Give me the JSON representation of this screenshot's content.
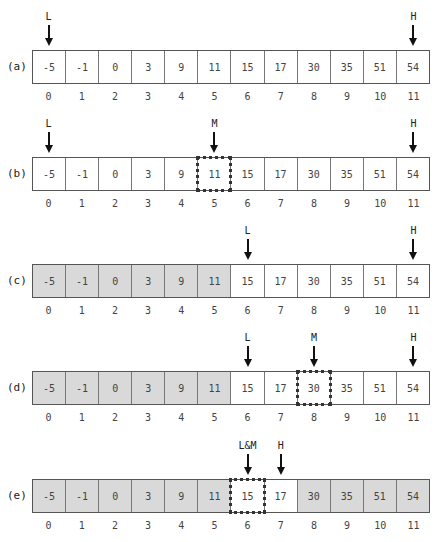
{
  "values": [
    "-5",
    "-1",
    "0",
    "3",
    "9",
    "11",
    "15",
    "17",
    "30",
    "35",
    "51",
    "54"
  ],
  "indices": [
    "0",
    "1",
    "2",
    "3",
    "4",
    "5",
    "6",
    "7",
    "8",
    "9",
    "10",
    "11"
  ],
  "rows": [
    {
      "label": "(a)",
      "grey": [],
      "mid": null,
      "pointers": [
        {
          "label": "L",
          "index": 0
        },
        {
          "label": "H",
          "index": 11
        }
      ]
    },
    {
      "label": "(b)",
      "grey": [],
      "mid": 5,
      "pointers": [
        {
          "label": "L",
          "index": 0
        },
        {
          "label": "M",
          "index": 5
        },
        {
          "label": "H",
          "index": 11
        }
      ]
    },
    {
      "label": "(c)",
      "grey": [
        0,
        1,
        2,
        3,
        4,
        5
      ],
      "mid": null,
      "pointers": [
        {
          "label": "L",
          "index": 6
        },
        {
          "label": "H",
          "index": 11
        }
      ]
    },
    {
      "label": "(d)",
      "grey": [
        0,
        1,
        2,
        3,
        4,
        5
      ],
      "mid": 8,
      "pointers": [
        {
          "label": "L",
          "index": 6
        },
        {
          "label": "M",
          "index": 8
        },
        {
          "label": "H",
          "index": 11
        }
      ]
    },
    {
      "label": "(e)",
      "grey": [
        0,
        1,
        2,
        3,
        4,
        5,
        8,
        9,
        10,
        11
      ],
      "mid": 6,
      "pointers": [
        {
          "label": "L&M",
          "index": 6
        },
        {
          "label": "H",
          "index": 7
        }
      ]
    }
  ],
  "colors": {
    "grey_cell": "#d9d9d9",
    "border": "#555555",
    "arrow": "#111111"
  }
}
